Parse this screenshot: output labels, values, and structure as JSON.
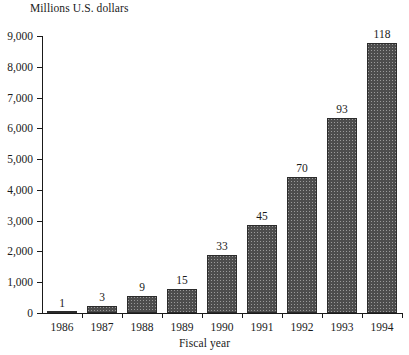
{
  "chart_data": {
    "type": "bar",
    "title": "",
    "subtitle": "",
    "xlabel": "Fiscal year",
    "ylabel": "Millions U.S. dollars",
    "categories": [
      "1986",
      "1987",
      "1988",
      "1989",
      "1990",
      "1991",
      "1992",
      "1993",
      "1994"
    ],
    "values": [
      20,
      220,
      560,
      790,
      1900,
      2870,
      4420,
      6350,
      8760
    ],
    "point_labels": [
      "1",
      "3",
      "9",
      "15",
      "33",
      "45",
      "70",
      "93",
      "118"
    ],
    "ylim": [
      0,
      9000
    ],
    "ytick_values": [
      0,
      1000,
      2000,
      3000,
      4000,
      5000,
      6000,
      7000,
      8000,
      9000
    ],
    "ytick_labels": [
      "0",
      "1,000",
      "2,000",
      "3,000",
      "4,000",
      "5,000",
      "6,000",
      "7,000",
      "8,000",
      "9,000"
    ],
    "grid": false,
    "legend": null,
    "legend_position": "none",
    "bar_color": "#4d4d4d",
    "bar_edge_color": "#2b2b2b",
    "axis_color": "#1a1a1a",
    "background_color": "#ffffff"
  }
}
